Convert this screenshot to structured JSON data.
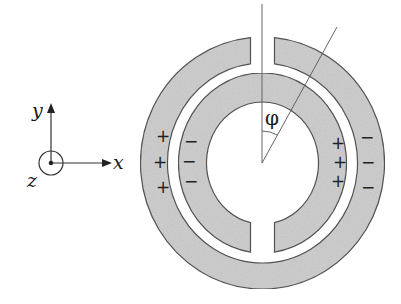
{
  "diagram": {
    "axes": {
      "x_label": "x",
      "y_label": "y",
      "z_label": "z",
      "z_symbol": "out-of-plane-dot-circle"
    },
    "angle_label": "φ",
    "outer_ring": {
      "gap_position": "top",
      "left_charges": [
        "+",
        "+",
        "+"
      ],
      "right_charges": [
        "−",
        "−",
        "−"
      ]
    },
    "inner_ring": {
      "gap_position": "bottom",
      "left_charges": [
        "−",
        "−",
        "−"
      ],
      "right_charges": [
        "+",
        "+",
        "+"
      ]
    },
    "colors": {
      "ring_fill": "#cfcfcf",
      "ring_stroke": "#555555",
      "line": "#444444"
    }
  }
}
